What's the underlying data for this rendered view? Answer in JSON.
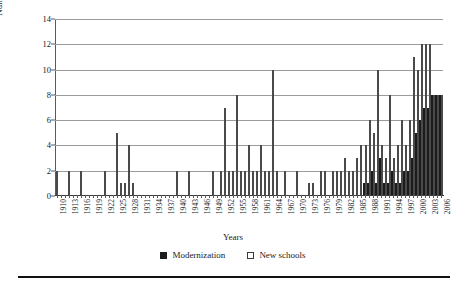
{
  "chart_data": {
    "type": "bar",
    "title": "",
    "xlabel": "Years",
    "ylabel": "Number of Schools",
    "ylim": [
      0,
      14
    ],
    "ytick_values": [
      0,
      2,
      4,
      6,
      8,
      10,
      12,
      14
    ],
    "grid": true,
    "legend_position": "bottom",
    "label_every_nth_category": 3,
    "categories": [
      "1910",
      "1911",
      "1912",
      "1913",
      "1914",
      "1915",
      "1916",
      "1917",
      "1918",
      "1919",
      "1920",
      "1921",
      "1922",
      "1923",
      "1924",
      "1925",
      "1926",
      "1927",
      "1928",
      "1929",
      "1930",
      "1931",
      "1932",
      "1933",
      "1934",
      "1935",
      "1936",
      "1937",
      "1938",
      "1939",
      "1940",
      "1941",
      "1942",
      "1943",
      "1944",
      "1945",
      "1946",
      "1947",
      "1948",
      "1949",
      "1950",
      "1951",
      "1952",
      "1953",
      "1954",
      "1955",
      "1956",
      "1957",
      "1958",
      "1959",
      "1960",
      "1961",
      "1962",
      "1963",
      "1964",
      "1965",
      "1966",
      "1967",
      "1968",
      "1969",
      "1970",
      "1971",
      "1972",
      "1973",
      "1974",
      "1975",
      "1976",
      "1977",
      "1978",
      "1979",
      "1980",
      "1981",
      "1982",
      "1983",
      "1984",
      "1985",
      "1986",
      "1987",
      "1988",
      "1989",
      "1990",
      "1991",
      "1992",
      "1993",
      "1994",
      "1995",
      "1996",
      "1997",
      "1998",
      "1999",
      "2000",
      "2001",
      "2002",
      "2003",
      "2004",
      "2005",
      "2006"
    ],
    "series": [
      {
        "name": "Modernization",
        "color": "#1c1c1c",
        "values": [
          0,
          0,
          0,
          0,
          0,
          0,
          0,
          0,
          0,
          0,
          0,
          0,
          0,
          0,
          0,
          0,
          0,
          0,
          0,
          0,
          0,
          0,
          0,
          0,
          0,
          0,
          0,
          0,
          0,
          0,
          0,
          0,
          0,
          0,
          0,
          0,
          0,
          0,
          0,
          0,
          0,
          0,
          0,
          0,
          0,
          0,
          0,
          0,
          0,
          0,
          0,
          0,
          0,
          0,
          0,
          0,
          0,
          0,
          0,
          0,
          0,
          0,
          0,
          0,
          0,
          0,
          0,
          0,
          0,
          0,
          0,
          0,
          0,
          0,
          0,
          0,
          0,
          1,
          1,
          2,
          1,
          3,
          1,
          1,
          2,
          1,
          1,
          2,
          2,
          3,
          5,
          6,
          7,
          7,
          8,
          8,
          8
        ]
      },
      {
        "name": "New schools",
        "color": "#ffffff",
        "values": [
          2,
          0,
          0,
          2,
          0,
          0,
          2,
          0,
          0,
          0,
          0,
          0,
          2,
          0,
          0,
          5,
          1,
          1,
          4,
          1,
          0,
          0,
          0,
          0,
          0,
          0,
          0,
          0,
          0,
          0,
          2,
          0,
          0,
          2,
          0,
          0,
          0,
          0,
          0,
          2,
          0,
          2,
          7,
          2,
          2,
          8,
          2,
          2,
          4,
          2,
          2,
          4,
          2,
          2,
          10,
          2,
          0,
          2,
          0,
          0,
          2,
          0,
          0,
          1,
          1,
          0,
          2,
          2,
          0,
          2,
          2,
          2,
          3,
          2,
          2,
          3,
          4,
          4,
          6,
          5,
          10,
          4,
          3,
          8,
          3,
          4,
          6,
          4,
          6,
          11,
          10,
          12,
          12,
          12,
          8,
          8,
          8
        ]
      }
    ]
  },
  "legend": {
    "items": [
      {
        "label": "Modernization",
        "marker": "filled-square"
      },
      {
        "label": "New schools",
        "marker": "open-square"
      }
    ]
  }
}
